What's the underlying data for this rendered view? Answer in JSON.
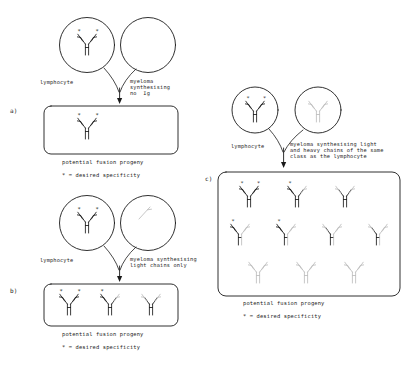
{
  "figure": {
    "background": "#ffffff",
    "ink": "#1a1a1a",
    "faint_ink": "#b9b9b9"
  },
  "panels": [
    {
      "id": "a",
      "marker": "a)",
      "cells": [
        {
          "name": "lymphocyte",
          "label": "lymphocyte",
          "content": "antibody",
          "style": "solid",
          "stars": 2
        },
        {
          "name": "myeloma",
          "label": "myeloma\nsynthesising\nno Ig",
          "content": "empty",
          "style": "none",
          "stars": 0
        }
      ],
      "progeny_caption": "potential fusion progeny",
      "key": "* = desired specificity",
      "progeny": [
        {
          "heavy": "solid",
          "left_light": "solid",
          "right_light": "solid",
          "stars": 2
        }
      ]
    },
    {
      "id": "b",
      "marker": "b)",
      "cells": [
        {
          "name": "lymphocyte",
          "label": "lymphocyte",
          "content": "antibody",
          "style": "solid",
          "stars": 2
        },
        {
          "name": "myeloma",
          "label": "myeloma synthesising\nlight chains only",
          "content": "light-chain",
          "style": "faint",
          "stars": 0
        }
      ],
      "progeny_caption": "potential fusion progeny",
      "key": "* = desired specificity",
      "progeny": [
        {
          "heavy": "solid",
          "left_light": "solid",
          "right_light": "solid",
          "stars": 2
        },
        {
          "heavy": "solid",
          "left_light": "solid",
          "right_light": "faint",
          "stars": 1
        },
        {
          "heavy": "solid",
          "left_light": "faint",
          "right_light": "faint",
          "stars": 0
        }
      ]
    },
    {
      "id": "c",
      "marker": "c)",
      "cells": [
        {
          "name": "lymphocyte",
          "label": "lymphocyte",
          "content": "antibody",
          "style": "solid",
          "stars": 2
        },
        {
          "name": "myeloma",
          "label": "myeloma synthesising light\nand heavy chains of the same\nclass as the lymphocyte",
          "content": "antibody",
          "style": "faint",
          "stars": 0
        }
      ],
      "progeny_caption": "potential fusion progeny",
      "key": "* = desired specificity",
      "progeny_rows": [
        [
          {
            "heavy": "solid",
            "left_light": "solid",
            "right_light": "solid",
            "stars": 2
          },
          {
            "heavy": "solid",
            "left_light": "solid",
            "right_light": "faint",
            "stars": 1
          },
          {
            "heavy": "solid",
            "left_light": "faint",
            "right_light": "faint",
            "stars": 0
          }
        ],
        [
          {
            "heavy": "mixed",
            "left_light": "solid",
            "right_light": "faint",
            "stars": 1
          },
          {
            "heavy": "mixed",
            "left_light": "solid",
            "right_light": "faint",
            "stars": 1
          },
          {
            "heavy": "mixed",
            "left_light": "faint",
            "right_light": "faint",
            "stars": 0
          },
          {
            "heavy": "mixed",
            "left_light": "faint",
            "right_light": "faint",
            "stars": 0
          }
        ],
        [
          {
            "heavy": "faint",
            "left_light": "faint",
            "right_light": "faint",
            "stars": 0
          },
          {
            "heavy": "faint",
            "left_light": "faint",
            "right_light": "faint",
            "stars": 0
          },
          {
            "heavy": "faint",
            "left_light": "faint",
            "right_light": "faint",
            "stars": 0
          }
        ]
      ]
    }
  ],
  "labels": {
    "a_marker": "a)",
    "b_marker": "b)",
    "c_marker": "c)",
    "a_lymphocyte": "lymphocyte",
    "a_myeloma_l1": "myeloma",
    "a_myeloma_l2": "synthesising",
    "a_myeloma_l3": "no  Ig",
    "a_caption": "potential fusion progeny",
    "a_key": "* = desired specificity",
    "b_lymphocyte": "lymphocyte",
    "b_myeloma_l1": "myeloma synthesising",
    "b_myeloma_l2": "light chains only",
    "b_caption": "potential fusion progeny",
    "b_key": "* = desired specificity",
    "c_lymphocyte": "lymphocyte",
    "c_myeloma_l1": "myeloma synthesising light",
    "c_myeloma_l2": "and heavy chains of the same",
    "c_myeloma_l3": "class as the lymphocyte",
    "c_caption": "potential fusion progeny",
    "c_key": "* = desired specificity"
  }
}
